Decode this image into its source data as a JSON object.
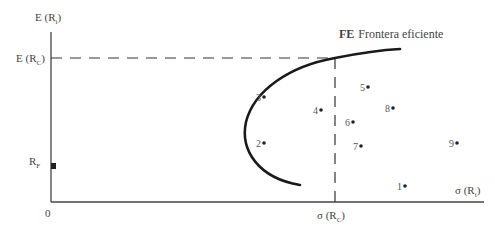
{
  "chart_data": {
    "type": "scatter",
    "title_bold_prefix": "FE",
    "title_rest": "Frontera eficiente",
    "xlabel": "σ (R_i)",
    "ylabel": "E (R_i)",
    "grid": false,
    "axis_labels": {
      "y_axis": {
        "main": "E (R",
        "sub": "i",
        "close": ")"
      },
      "x_axis": {
        "main": "σ (R",
        "sub": "i",
        "close": ")"
      },
      "origin": "0",
      "erc": {
        "main": "E (R",
        "sub": "C",
        "close": ")"
      },
      "src": {
        "main": "σ (R",
        "sub": "C",
        "close": ")"
      },
      "rf": {
        "main": "R",
        "sub": "F"
      }
    },
    "reference_lines": [
      {
        "name": "E(R_C)",
        "orientation": "horizontal",
        "style": "dashed"
      },
      {
        "name": "σ(R_C)",
        "orientation": "vertical",
        "style": "dashed"
      }
    ],
    "risk_free_point": {
      "label": "R_F",
      "marker": "square"
    },
    "efficient_frontier": {
      "label": "FE",
      "shape": "hyperbola (upper branch bold curve)"
    },
    "points": [
      {
        "label": "1",
        "x": 405,
        "y": 186
      },
      {
        "label": "2",
        "x": 264,
        "y": 143
      },
      {
        "label": "3",
        "x": 264,
        "y": 97
      },
      {
        "label": "4",
        "x": 321,
        "y": 110
      },
      {
        "label": "5",
        "x": 368,
        "y": 87
      },
      {
        "label": "6",
        "x": 353,
        "y": 122
      },
      {
        "label": "7",
        "x": 361,
        "y": 146
      },
      {
        "label": "8",
        "x": 393,
        "y": 108
      },
      {
        "label": "9",
        "x": 457,
        "y": 143
      }
    ]
  }
}
